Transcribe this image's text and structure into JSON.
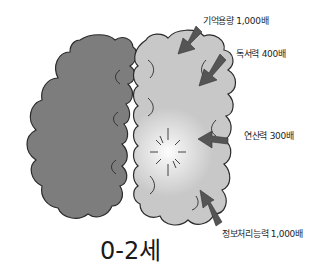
{
  "diagram": {
    "title": "0-2세",
    "left_hemisphere": {
      "color": "#7d7d7d"
    },
    "right_hemisphere": {
      "color": "#c9c9c9",
      "highlight": "#f4f4f4"
    },
    "arrow_color": "#555555",
    "labels": [
      {
        "text": "기억용량 1,000배"
      },
      {
        "text": "독서력 400배"
      },
      {
        "text": "연산력 300배"
      },
      {
        "text": "정보처리능력 1,000배"
      }
    ]
  }
}
